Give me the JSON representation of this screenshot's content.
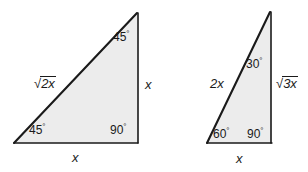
{
  "figure": {
    "background_color": "#ffffff",
    "stroke_color": "#1a1a1a",
    "fill_color": "#ececec",
    "text_color": "#1a1a1a"
  },
  "triangles": [
    {
      "name": "45-45-90 triangle",
      "vertices": {
        "apex": [
          137,
          13
        ],
        "bottom_left": [
          14,
          143
        ],
        "bottom_right": [
          138,
          143
        ]
      },
      "angles": [
        {
          "id": "apex",
          "value": "45",
          "degree_symbol": "°"
        },
        {
          "id": "bottom-left",
          "value": "45",
          "degree_symbol": "°"
        },
        {
          "id": "bottom-right",
          "value": "90",
          "degree_symbol": "°"
        }
      ],
      "sides": {
        "hypotenuse": {
          "radical": "√",
          "radicand": "2x"
        },
        "vertical": "x",
        "base": "x"
      }
    },
    {
      "name": "30-60-90 triangle",
      "vertices": {
        "apex": [
          270,
          12
        ],
        "bottom_left": [
          207,
          143
        ],
        "bottom_right": [
          272,
          143
        ]
      },
      "angles": [
        {
          "id": "apex",
          "value": "30",
          "degree_symbol": "°"
        },
        {
          "id": "bottom-left",
          "value": "60",
          "degree_symbol": "°"
        },
        {
          "id": "bottom-right",
          "value": "90",
          "degree_symbol": "°"
        }
      ],
      "sides": {
        "hypotenuse": "2x",
        "vertical": {
          "radical": "√",
          "radicand": "3x"
        },
        "base": "x"
      }
    }
  ]
}
